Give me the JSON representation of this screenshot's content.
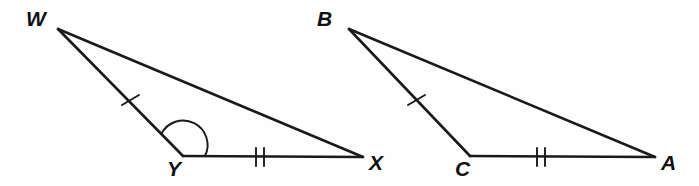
{
  "figure": {
    "background_color": "#fefefe",
    "stroke_color": "#1a1a1a",
    "width": 699,
    "height": 186
  },
  "triangles": [
    {
      "name": "triangle-wyx",
      "vertices": [
        {
          "label": "W",
          "x": 58,
          "y": 29,
          "label_x": 26,
          "label_y": 8
        },
        {
          "label": "Y",
          "x": 183,
          "y": 156,
          "label_x": 167,
          "label_y": 158
        },
        {
          "label": "X",
          "x": 363,
          "y": 157,
          "label_x": 369,
          "label_y": 152
        }
      ],
      "sides": [
        {
          "name": "side-wy",
          "from": "W",
          "to": "Y",
          "ticks": 1
        },
        {
          "name": "side-yx",
          "from": "Y",
          "to": "X",
          "ticks": 2
        },
        {
          "name": "side-wx",
          "from": "W",
          "to": "X",
          "ticks": 0
        }
      ],
      "angle_marks": [
        {
          "name": "angle-y",
          "vertex": "Y",
          "radius": 22,
          "arcs": 1
        }
      ]
    },
    {
      "name": "triangle-bca",
      "vertices": [
        {
          "label": "B",
          "x": 349,
          "y": 29,
          "label_x": 317,
          "label_y": 8
        },
        {
          "label": "C",
          "x": 470,
          "y": 156,
          "label_x": 455,
          "label_y": 158
        },
        {
          "label": "A",
          "x": 655,
          "y": 157,
          "label_x": 661,
          "label_y": 152
        }
      ],
      "sides": [
        {
          "name": "side-bc",
          "from": "B",
          "to": "C",
          "ticks": 1
        },
        {
          "name": "side-ca",
          "from": "C",
          "to": "A",
          "ticks": 2
        },
        {
          "name": "side-ba",
          "from": "B",
          "to": "A",
          "ticks": 0
        }
      ],
      "angle_marks": []
    }
  ],
  "chart_data": {
    "type": "diagram",
    "shapes": [
      {
        "id": "triangle-wyx",
        "points": [
          [
            58,
            29
          ],
          [
            183,
            156
          ],
          [
            363,
            157
          ]
        ],
        "labels": [
          "W",
          "Y",
          "X"
        ]
      },
      {
        "id": "triangle-bca",
        "points": [
          [
            349,
            29
          ],
          [
            470,
            156
          ],
          [
            655,
            157
          ]
        ],
        "labels": [
          "B",
          "C",
          "A"
        ]
      }
    ],
    "congruence_marks": {
      "single_tick": [
        "WY",
        "BC"
      ],
      "double_tick": [
        "YX",
        "CA"
      ],
      "angle_arc": [
        "Y"
      ]
    }
  }
}
